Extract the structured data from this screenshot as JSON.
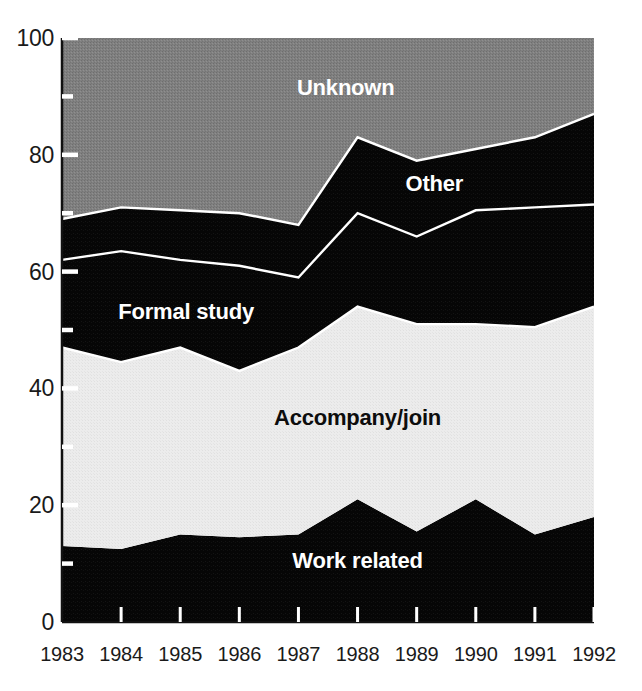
{
  "chart_data": {
    "type": "area",
    "title": "",
    "subtitle": "",
    "xlabel": "",
    "ylabel": "",
    "stacked": true,
    "grid": false,
    "legend_position": "inline-labels",
    "xlim": [
      1983,
      1992
    ],
    "ylim": [
      0,
      100
    ],
    "categories": [
      "1983",
      "1984",
      "1985",
      "1986",
      "1987",
      "1988",
      "1989",
      "1990",
      "1991",
      "1992"
    ],
    "x": [
      1983,
      1984,
      1985,
      1986,
      1987,
      1988,
      1989,
      1990,
      1991,
      1992
    ],
    "y_ticks_major": [
      0,
      20,
      40,
      60,
      80,
      100
    ],
    "y_tick_labels": [
      "0",
      "20",
      "40",
      "60",
      "80",
      "100"
    ],
    "y_ticks_minor": [
      10,
      30,
      50,
      70,
      90
    ],
    "series": [
      {
        "name": "Work related",
        "color": "#000000",
        "label_color": "#ffffff",
        "values": [
          13,
          12.5,
          15,
          14.5,
          15,
          21,
          15.5,
          21,
          15,
          18
        ]
      },
      {
        "name": "Accompany/join",
        "color": "#ebebeb",
        "label_color": "#0d0d0d",
        "values": [
          34,
          32,
          32,
          28.5,
          32,
          33,
          35.5,
          30,
          35.5,
          36
        ]
      },
      {
        "name": "Formal study",
        "color": "#0a0a0a",
        "label_color": "#ffffff",
        "values": [
          15,
          19,
          15,
          18,
          12,
          16,
          15,
          19.5,
          20.5,
          17.5
        ]
      },
      {
        "name": "Other",
        "color": "#0a0a0a",
        "label_color": "#ffffff",
        "values": [
          7,
          7.5,
          8.5,
          9,
          9,
          13,
          13,
          10.5,
          12,
          15.5
        ]
      },
      {
        "name": "Unknown",
        "color": "#7d7d7d",
        "label_color": "#ffffff",
        "values": [
          31,
          29,
          29.5,
          32,
          32,
          17,
          21,
          19,
          17,
          13
        ]
      }
    ],
    "cumulative_tops": {
      "work_related": [
        13,
        12.5,
        15,
        14.5,
        15,
        21,
        15.5,
        21,
        15,
        18
      ],
      "accompany_join": [
        47,
        44.5,
        47,
        43,
        47,
        54,
        51,
        51,
        50.5,
        54
      ],
      "formal_study": [
        62,
        63.5,
        62,
        61,
        59,
        70,
        66,
        70.5,
        71,
        71.5
      ],
      "other": [
        69,
        71,
        70.5,
        70,
        68,
        83,
        79,
        81,
        83,
        87
      ],
      "unknown": [
        100,
        100,
        100,
        100,
        100,
        100,
        100,
        100,
        100,
        100
      ]
    },
    "annotations": [
      {
        "text": "Unknown",
        "x_value": 1987.8,
        "y_value": 91.5,
        "tone": "light"
      },
      {
        "text": "Other",
        "x_value": 1989.3,
        "y_value": 75.0,
        "tone": "light"
      },
      {
        "text": "Formal study",
        "x_value": 1985.1,
        "y_value": 53.0,
        "tone": "light"
      },
      {
        "text": "Accompany/join",
        "x_value": 1988.0,
        "y_value": 35.0,
        "tone": "dark"
      },
      {
        "text": "Work related",
        "x_value": 1988.0,
        "y_value": 10.5,
        "tone": "light"
      }
    ]
  }
}
